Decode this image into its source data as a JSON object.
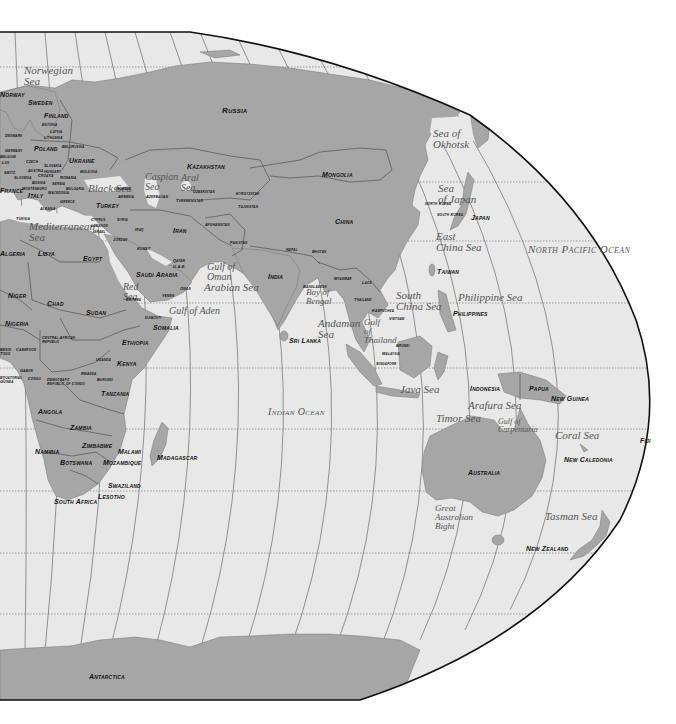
{
  "map": {
    "title": "World Map — Eastern Hemisphere (Europe, Africa, Asia, Oceania)",
    "projection": "Robinson-style, right half",
    "colors": {
      "land": "#a6a6a6",
      "water": "#e8e8e8",
      "border": "#444444",
      "outline": "#111111",
      "background": "#ffffff"
    },
    "oceans": [
      {
        "id": "north-pacific",
        "label": "North Pacific Ocean",
        "x": 528,
        "y": 243,
        "size": 11
      },
      {
        "id": "indian",
        "label": "Indian Ocean",
        "x": 268,
        "y": 406,
        "size": 10
      }
    ],
    "seas": [
      {
        "id": "norwegian-sea",
        "label": "Norwegian\nSea",
        "x": 24,
        "y": 65,
        "size": 11
      },
      {
        "id": "black-sea",
        "label": "Black Sea",
        "x": 88,
        "y": 183,
        "size": 11
      },
      {
        "id": "caspian-sea",
        "label": "Caspian\nSea",
        "x": 145,
        "y": 172,
        "size": 10
      },
      {
        "id": "aral-sea",
        "label": "Aral\nSea",
        "x": 181,
        "y": 173,
        "size": 10
      },
      {
        "id": "mediterranean-sea",
        "label": "Mediterranean\nSea",
        "x": 29,
        "y": 221,
        "size": 11
      },
      {
        "id": "red-sea",
        "label": "Red\nSea",
        "x": 123,
        "y": 282,
        "size": 10
      },
      {
        "id": "gulf-of-oman",
        "label": "Gulf of\nOman",
        "x": 207,
        "y": 262,
        "size": 10
      },
      {
        "id": "arabian-sea",
        "label": "Arabian Sea",
        "x": 204,
        "y": 282,
        "size": 11
      },
      {
        "id": "gulf-of-aden",
        "label": "Gulf of Aden",
        "x": 169,
        "y": 306,
        "size": 10
      },
      {
        "id": "bay-of-bengal",
        "label": "Bay of\nBengal",
        "x": 306,
        "y": 288,
        "size": 9
      },
      {
        "id": "andaman-sea",
        "label": "Andaman\nSea",
        "x": 318,
        "y": 318,
        "size": 11
      },
      {
        "id": "gulf-of-thailand",
        "label": "Gulf\nof\nThailand",
        "x": 364,
        "y": 318,
        "size": 9
      },
      {
        "id": "south-china-sea",
        "label": "South\nChina Sea",
        "x": 396,
        "y": 290,
        "size": 11
      },
      {
        "id": "philippine-sea",
        "label": "Philippine Sea",
        "x": 458,
        "y": 292,
        "size": 11
      },
      {
        "id": "east-china-sea",
        "label": "East\nChina Sea",
        "x": 436,
        "y": 231,
        "size": 11
      },
      {
        "id": "sea-of-japan",
        "label": "Sea\nof Japan",
        "x": 438,
        "y": 183,
        "size": 11
      },
      {
        "id": "sea-of-okhotsk",
        "label": "Sea of\nOkhotsk",
        "x": 433,
        "y": 128,
        "size": 11
      },
      {
        "id": "java-sea",
        "label": "Java Sea",
        "x": 400,
        "y": 384,
        "size": 11
      },
      {
        "id": "arafura-sea",
        "label": "Arafura Sea",
        "x": 468,
        "y": 400,
        "size": 11
      },
      {
        "id": "timor-sea",
        "label": "Timor Sea",
        "x": 436,
        "y": 413,
        "size": 11
      },
      {
        "id": "gulf-of-carpentaria",
        "label": "Gulf of\nCarpentaria",
        "x": 498,
        "y": 418,
        "size": 8
      },
      {
        "id": "coral-sea",
        "label": "Coral Sea",
        "x": 555,
        "y": 430,
        "size": 11
      },
      {
        "id": "great-australian-bight",
        "label": "Great\nAustralian\nBight",
        "x": 435,
        "y": 504,
        "size": 9
      },
      {
        "id": "tasman-sea",
        "label": "Tasman Sea",
        "x": 545,
        "y": 511,
        "size": 11
      }
    ],
    "countries": [
      {
        "id": "russia",
        "label": "Russia",
        "x": 222,
        "y": 107,
        "size": 8
      },
      {
        "id": "norway",
        "label": "Norway",
        "x": 0,
        "y": 91,
        "size": 7
      },
      {
        "id": "sweden",
        "label": "Sweden",
        "x": 28,
        "y": 99,
        "size": 7
      },
      {
        "id": "finland",
        "label": "Finland",
        "x": 44,
        "y": 112,
        "size": 7
      },
      {
        "id": "estonia",
        "label": "Estonia",
        "x": 42,
        "y": 123,
        "size": 4
      },
      {
        "id": "latvia",
        "label": "Latvia",
        "x": 50,
        "y": 130,
        "size": 4
      },
      {
        "id": "lithuania",
        "label": "Lithuania",
        "x": 44,
        "y": 136,
        "size": 4
      },
      {
        "id": "denmark",
        "label": "Denmark",
        "x": 5,
        "y": 134,
        "size": 4
      },
      {
        "id": "poland",
        "label": "Poland",
        "x": 34,
        "y": 145,
        "size": 7
      },
      {
        "id": "belorussia",
        "label": "Belorussia",
        "x": 62,
        "y": 145,
        "size": 4
      },
      {
        "id": "germany",
        "label": "Germany",
        "x": 5,
        "y": 149,
        "size": 4
      },
      {
        "id": "belgium",
        "label": "Belgium",
        "x": 0,
        "y": 155,
        "size": 4
      },
      {
        "id": "lux",
        "label": "Lux.",
        "x": 2,
        "y": 161,
        "size": 4
      },
      {
        "id": "czech",
        "label": "Czech",
        "x": 26,
        "y": 160,
        "size": 4
      },
      {
        "id": "slovakia",
        "label": "Slovakia",
        "x": 44,
        "y": 164,
        "size": 4
      },
      {
        "id": "ukraine",
        "label": "Ukraine",
        "x": 69,
        "y": 157,
        "size": 7
      },
      {
        "id": "moldova",
        "label": "Moldova",
        "x": 80,
        "y": 170,
        "size": 4
      },
      {
        "id": "austria",
        "label": "Austria",
        "x": 28,
        "y": 169,
        "size": 4
      },
      {
        "id": "hungary",
        "label": "Hungary",
        "x": 44,
        "y": 170,
        "size": 4
      },
      {
        "id": "switzerland",
        "label": "Switz.",
        "x": 4,
        "y": 171,
        "size": 4
      },
      {
        "id": "slovenia",
        "label": "Slovenia",
        "x": 14,
        "y": 176,
        "size": 4
      },
      {
        "id": "croatia",
        "label": "Croatia",
        "x": 38,
        "y": 174,
        "size": 4
      },
      {
        "id": "romania",
        "label": "Romania",
        "x": 60,
        "y": 176,
        "size": 4
      },
      {
        "id": "bosnia",
        "label": "Bosnia",
        "x": 32,
        "y": 181,
        "size": 4
      },
      {
        "id": "serbia",
        "label": "Serbia",
        "x": 52,
        "y": 182,
        "size": 4
      },
      {
        "id": "france",
        "label": "France",
        "x": 0,
        "y": 187,
        "size": 7
      },
      {
        "id": "montenegro",
        "label": "Montenegro",
        "x": 22,
        "y": 187,
        "size": 4
      },
      {
        "id": "bulgaria",
        "label": "Bulgaria",
        "x": 66,
        "y": 187,
        "size": 4
      },
      {
        "id": "macedonia",
        "label": "Macedonia",
        "x": 48,
        "y": 191,
        "size": 4
      },
      {
        "id": "italy",
        "label": "Italy",
        "x": 28,
        "y": 192,
        "size": 7
      },
      {
        "id": "albania",
        "label": "Albania",
        "x": 40,
        "y": 207,
        "size": 4
      },
      {
        "id": "greece",
        "label": "Greece",
        "x": 60,
        "y": 200,
        "size": 4
      },
      {
        "id": "turkey",
        "label": "Turkey",
        "x": 96,
        "y": 202,
        "size": 7
      },
      {
        "id": "georgia",
        "label": "Georgia",
        "x": 114,
        "y": 187,
        "size": 4
      },
      {
        "id": "armenia",
        "label": "Armenia",
        "x": 118,
        "y": 195,
        "size": 4
      },
      {
        "id": "azerbaijan",
        "label": "Azerbaijan",
        "x": 146,
        "y": 195,
        "size": 4
      },
      {
        "id": "tunisia",
        "label": "Tunisia",
        "x": 16,
        "y": 217,
        "size": 4
      },
      {
        "id": "cyprus",
        "label": "Cyprus",
        "x": 91,
        "y": 218,
        "size": 4
      },
      {
        "id": "syria",
        "label": "Syria",
        "x": 117,
        "y": 218,
        "size": 4
      },
      {
        "id": "lebanon",
        "label": "Lebanon",
        "x": 91,
        "y": 224,
        "size": 4
      },
      {
        "id": "israel",
        "label": "Israel",
        "x": 93,
        "y": 230,
        "size": 4
      },
      {
        "id": "iraq",
        "label": "Iraq",
        "x": 135,
        "y": 228,
        "size": 4
      },
      {
        "id": "jordan",
        "label": "Jordan",
        "x": 113,
        "y": 238,
        "size": 4
      },
      {
        "id": "kuwait",
        "label": "Kuwait",
        "x": 137,
        "y": 247,
        "size": 4
      },
      {
        "id": "algeria",
        "label": "Algeria",
        "x": 0,
        "y": 250,
        "size": 7
      },
      {
        "id": "libya",
        "label": "Libya",
        "x": 38,
        "y": 250,
        "size": 7
      },
      {
        "id": "egypt",
        "label": "Egypt",
        "x": 83,
        "y": 255,
        "size": 7
      },
      {
        "id": "saudi-arabia",
        "label": "Saudi Arabia",
        "x": 136,
        "y": 271,
        "size": 7
      },
      {
        "id": "qatar",
        "label": "Qatar",
        "x": 173,
        "y": 259,
        "size": 4
      },
      {
        "id": "uae",
        "label": "U.A.E.",
        "x": 173,
        "y": 265,
        "size": 4
      },
      {
        "id": "oman",
        "label": "Oman",
        "x": 180,
        "y": 287,
        "size": 4
      },
      {
        "id": "yemen",
        "label": "Yemen",
        "x": 162,
        "y": 294,
        "size": 4
      },
      {
        "id": "eritrea",
        "label": "Eritrea",
        "x": 126,
        "y": 298,
        "size": 4
      },
      {
        "id": "kazakhstan",
        "label": "Kazakhstan",
        "x": 187,
        "y": 163,
        "size": 7
      },
      {
        "id": "uzbekistan",
        "label": "Uzbekistan",
        "x": 193,
        "y": 190,
        "size": 4
      },
      {
        "id": "turkmenistan",
        "label": "Turkmenistan",
        "x": 176,
        "y": 199,
        "size": 4
      },
      {
        "id": "kyrgyzstan",
        "label": "Kyrgyzstan",
        "x": 236,
        "y": 192,
        "size": 4
      },
      {
        "id": "tajikistan",
        "label": "Tajikistan",
        "x": 238,
        "y": 205,
        "size": 4
      },
      {
        "id": "iran",
        "label": "Iran",
        "x": 173,
        "y": 227,
        "size": 7
      },
      {
        "id": "afghanistan",
        "label": "Afghanistan",
        "x": 205,
        "y": 223,
        "size": 4
      },
      {
        "id": "pakistan",
        "label": "Pakistan",
        "x": 230,
        "y": 241,
        "size": 4
      },
      {
        "id": "india",
        "label": "India",
        "x": 268,
        "y": 273,
        "size": 7
      },
      {
        "id": "nepal",
        "label": "Nepal",
        "x": 286,
        "y": 248,
        "size": 4
      },
      {
        "id": "bhutan",
        "label": "Bhutan",
        "x": 312,
        "y": 250,
        "size": 4
      },
      {
        "id": "bangladesh",
        "label": "Bangladesh",
        "x": 303,
        "y": 285,
        "size": 4
      },
      {
        "id": "mongolia",
        "label": "Mongolia",
        "x": 322,
        "y": 171,
        "size": 7
      },
      {
        "id": "china",
        "label": "China",
        "x": 335,
        "y": 218,
        "size": 7
      },
      {
        "id": "north-korea",
        "label": "North Korea",
        "x": 425,
        "y": 202,
        "size": 4
      },
      {
        "id": "south-korea",
        "label": "South Korea",
        "x": 437,
        "y": 213,
        "size": 4
      },
      {
        "id": "japan",
        "label": "Japan",
        "x": 471,
        "y": 214,
        "size": 7
      },
      {
        "id": "taiwan",
        "label": "Taiwan",
        "x": 437,
        "y": 268,
        "size": 7
      },
      {
        "id": "myanmar",
        "label": "Myanmar",
        "x": 334,
        "y": 277,
        "size": 4
      },
      {
        "id": "laos",
        "label": "Laos",
        "x": 362,
        "y": 281,
        "size": 4
      },
      {
        "id": "thailand",
        "label": "Thailand",
        "x": 354,
        "y": 298,
        "size": 4
      },
      {
        "id": "kampuchea",
        "label": "Kampuchea",
        "x": 372,
        "y": 309,
        "size": 4
      },
      {
        "id": "vietnam",
        "label": "Vietnam",
        "x": 389,
        "y": 317,
        "size": 4
      },
      {
        "id": "philippines",
        "label": "Philippines",
        "x": 453,
        "y": 310,
        "size": 7
      },
      {
        "id": "sri-lanka",
        "label": "Sri Lanka",
        "x": 289,
        "y": 337,
        "size": 7
      },
      {
        "id": "brunei",
        "label": "Brunei",
        "x": 396,
        "y": 344,
        "size": 4
      },
      {
        "id": "malaysia",
        "label": "Malaysia",
        "x": 382,
        "y": 352,
        "size": 4
      },
      {
        "id": "singapore",
        "label": "Singapore",
        "x": 376,
        "y": 362,
        "size": 4
      },
      {
        "id": "indonesia",
        "label": "Indonesia",
        "x": 470,
        "y": 385,
        "size": 7
      },
      {
        "id": "papua",
        "label": "Papua",
        "x": 529,
        "y": 385,
        "size": 7
      },
      {
        "id": "new-guinea",
        "label": "New Guinea",
        "x": 551,
        "y": 395,
        "size": 7
      },
      {
        "id": "fiji",
        "label": "Fiji",
        "x": 640,
        "y": 437,
        "size": 7
      },
      {
        "id": "new-caledonia",
        "label": "New Caledonia",
        "x": 564,
        "y": 456,
        "size": 7
      },
      {
        "id": "australia",
        "label": "Australia",
        "x": 468,
        "y": 469,
        "size": 7
      },
      {
        "id": "new-zealand",
        "label": "New Zealand",
        "x": 526,
        "y": 545,
        "size": 7
      },
      {
        "id": "niger",
        "label": "Niger",
        "x": 8,
        "y": 292,
        "size": 7
      },
      {
        "id": "chad",
        "label": "Chad",
        "x": 47,
        "y": 300,
        "size": 7
      },
      {
        "id": "sudan",
        "label": "Sudan",
        "x": 86,
        "y": 309,
        "size": 7
      },
      {
        "id": "nigeria",
        "label": "Nigeria",
        "x": 5,
        "y": 320,
        "size": 7
      },
      {
        "id": "djibouti",
        "label": "Djibouti",
        "x": 145,
        "y": 316,
        "size": 4
      },
      {
        "id": "somalia",
        "label": "Somalia",
        "x": 153,
        "y": 324,
        "size": 7
      },
      {
        "id": "central-african-republic",
        "label": "Central African\nRepublic",
        "x": 42,
        "y": 336,
        "size": 4
      },
      {
        "id": "ethiopia",
        "label": "Ethiopia",
        "x": 122,
        "y": 339,
        "size": 7
      },
      {
        "id": "benin-togo",
        "label": "Benin\nTogo",
        "x": 0,
        "y": 348,
        "size": 4
      },
      {
        "id": "cameroon",
        "label": "Cameroon",
        "x": 16,
        "y": 348,
        "size": 4
      },
      {
        "id": "uganda",
        "label": "Uganda",
        "x": 96,
        "y": 358,
        "size": 4
      },
      {
        "id": "kenya",
        "label": "Kenya",
        "x": 117,
        "y": 360,
        "size": 7
      },
      {
        "id": "equatorial-guinea",
        "label": "Equatorial\nGuinea",
        "x": 0,
        "y": 376,
        "size": 4
      },
      {
        "id": "gabon",
        "label": "Gabon",
        "x": 20,
        "y": 369,
        "size": 4
      },
      {
        "id": "rwanda",
        "label": "Rwanda",
        "x": 81,
        "y": 372,
        "size": 4
      },
      {
        "id": "congo",
        "label": "Congo",
        "x": 28,
        "y": 377,
        "size": 4
      },
      {
        "id": "burundi",
        "label": "Burundi",
        "x": 97,
        "y": 378,
        "size": 4
      },
      {
        "id": "democratic-republic-of-congo",
        "label": "Democratic\nRepublic of Congo",
        "x": 47,
        "y": 378,
        "size": 4
      },
      {
        "id": "tanzania",
        "label": "Tanzania",
        "x": 101,
        "y": 390,
        "size": 7
      },
      {
        "id": "angola",
        "label": "Angola",
        "x": 38,
        "y": 408,
        "size": 7
      },
      {
        "id": "zambia",
        "label": "Zambia",
        "x": 70,
        "y": 424,
        "size": 7
      },
      {
        "id": "zimbabwe",
        "label": "Zimbabwe",
        "x": 82,
        "y": 442,
        "size": 7
      },
      {
        "id": "malawi",
        "label": "Malawi",
        "x": 118,
        "y": 448,
        "size": 7
      },
      {
        "id": "namibia",
        "label": "Namibia",
        "x": 35,
        "y": 448,
        "size": 7
      },
      {
        "id": "madagascar",
        "label": "Madagascar",
        "x": 157,
        "y": 454,
        "size": 7
      },
      {
        "id": "botswana",
        "label": "Botswana",
        "x": 60,
        "y": 459,
        "size": 7
      },
      {
        "id": "mozambique",
        "label": "Mozambique",
        "x": 103,
        "y": 459,
        "size": 7
      },
      {
        "id": "swaziland",
        "label": "Swaziland",
        "x": 108,
        "y": 482,
        "size": 7
      },
      {
        "id": "lesotho",
        "label": "Lesotho",
        "x": 98,
        "y": 493,
        "size": 7
      },
      {
        "id": "south-africa",
        "label": "South Africa",
        "x": 54,
        "y": 498,
        "size": 7
      },
      {
        "id": "antarctica",
        "label": "Antarctica",
        "x": 89,
        "y": 673,
        "size": 7
      }
    ]
  }
}
